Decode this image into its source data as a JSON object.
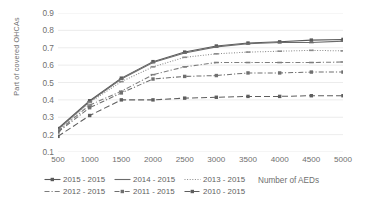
{
  "chart_data": {
    "type": "line",
    "title": "",
    "subtitle": "",
    "xlabel": "Number of AEDs",
    "ylabel": "Part of covered OHCAs",
    "x": [
      500,
      1000,
      1500,
      2000,
      2500,
      3000,
      3500,
      4000,
      4500,
      5000
    ],
    "xtick_labels": [
      "500",
      "1000",
      "1500",
      "2000",
      "2500",
      "3000",
      "3500",
      "4000",
      "4500",
      "5000"
    ],
    "ytick_labels": [
      "0.9",
      "0.8",
      "0.7",
      "0.6",
      "0.5",
      "0.4",
      "0.3",
      "0.2",
      "0.1"
    ],
    "ytick_values": [
      0.9,
      0.8,
      0.7,
      0.6,
      0.5,
      0.4,
      0.3,
      0.2,
      0.1
    ],
    "xlim": [
      500,
      5000
    ],
    "ylim": [
      0.1,
      0.9
    ],
    "grid": "horizontal",
    "legend_position": "bottom-left",
    "series": [
      {
        "name": "2015 - 2015",
        "style": "solid",
        "marker": "square",
        "color": "#595959",
        "values": [
          0.235,
          0.395,
          0.525,
          0.62,
          0.675,
          0.71,
          0.727,
          0.734,
          0.744,
          0.748
        ]
      },
      {
        "name": "2014 - 2015",
        "style": "solid",
        "marker": "dash",
        "color": "#6b6b6b",
        "values": [
          0.23,
          0.39,
          0.52,
          0.615,
          0.67,
          0.705,
          0.723,
          0.73,
          0.73,
          0.738
        ]
      },
      {
        "name": "2013 - 2015",
        "style": "dotted",
        "marker": "dash",
        "color": "#8a8a8a",
        "values": [
          0.225,
          0.385,
          0.505,
          0.59,
          0.645,
          0.665,
          0.675,
          0.68,
          0.685,
          0.682
        ]
      },
      {
        "name": "2012 - 2015",
        "style": "dash-dot",
        "marker": "dash",
        "color": "#7d7d7d",
        "values": [
          0.22,
          0.37,
          0.45,
          0.545,
          0.59,
          0.615,
          0.615,
          0.615,
          0.615,
          0.618
        ]
      },
      {
        "name": "2011 - 2015",
        "style": "dash-dot",
        "marker": "square",
        "color": "#6f6f6f",
        "values": [
          0.215,
          0.355,
          0.44,
          0.52,
          0.535,
          0.54,
          0.555,
          0.555,
          0.56,
          0.56
        ]
      },
      {
        "name": "2010 - 2015",
        "style": "dashed",
        "marker": "square",
        "color": "#5e5e5e",
        "values": [
          0.19,
          0.31,
          0.4,
          0.4,
          0.41,
          0.415,
          0.42,
          0.42,
          0.424,
          0.424
        ]
      }
    ]
  },
  "axes": {
    "y_title": "Part of covered OHCAs",
    "x_title": "Number of AEDs"
  },
  "legend": {
    "items": [
      {
        "label": "2015 - 2015"
      },
      {
        "label": "2014 - 2015"
      },
      {
        "label": "2013 - 2015"
      },
      {
        "label": "2012 - 2015"
      },
      {
        "label": "2011 - 2015"
      },
      {
        "label": "2010 - 2015"
      }
    ]
  },
  "colors": {
    "grid": "#e4e4e4",
    "text": "#6f6f6f",
    "background": "#ffffff"
  }
}
